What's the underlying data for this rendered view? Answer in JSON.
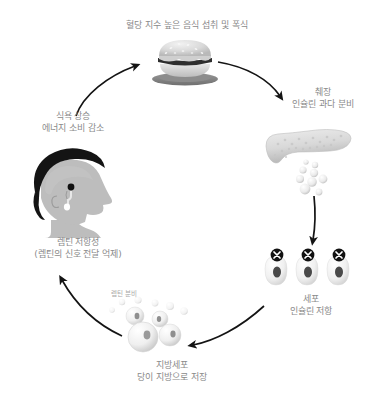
{
  "diagram": {
    "title_visible": false,
    "background_color": "#ffffff",
    "text_color": "#8a8a8a",
    "arrow_color": "#111111",
    "nodes": [
      {
        "id": "food",
        "icon": "hamburger-icon",
        "label_line1": "혈당 지수 높은 음식 섭취 및 폭식",
        "label_line2": ""
      },
      {
        "id": "pancreas",
        "icon": "pancreas-icon",
        "label_line1": "췌장",
        "label_line2": "인슐린 과다 분비"
      },
      {
        "id": "cells",
        "icon": "blocked-cells-icon",
        "label_line1": "세포",
        "label_line2": "인슐린 저항"
      },
      {
        "id": "fat",
        "icon": "fat-cells-icon",
        "label_line1": "지방세포",
        "label_line2": "당이 지방으로 저장"
      },
      {
        "id": "leptin_secretion",
        "icon": "leptin-bubbles-icon",
        "label_line1": "렙틴 분비",
        "label_line2": ""
      },
      {
        "id": "brain",
        "icon": "head-profile-icon",
        "label_line1": "렙틴 저항성",
        "label_line2": "(렙틴의 신호 전달 억제)"
      },
      {
        "id": "appetite",
        "icon": "",
        "label_line1": "식욕 상승",
        "label_line2": "에너지 소비 감소"
      }
    ],
    "arrows": [
      {
        "id": "appetite-to-food",
        "from": "appetite",
        "to": "food"
      },
      {
        "id": "food-to-pancreas",
        "from": "food",
        "to": "pancreas"
      },
      {
        "id": "pancreas-to-cells",
        "from": "pancreas",
        "to": "cells"
      },
      {
        "id": "cells-to-fat",
        "from": "cells",
        "to": "fat"
      },
      {
        "id": "fat-to-brain",
        "from": "fat",
        "to": "brain"
      }
    ]
  }
}
